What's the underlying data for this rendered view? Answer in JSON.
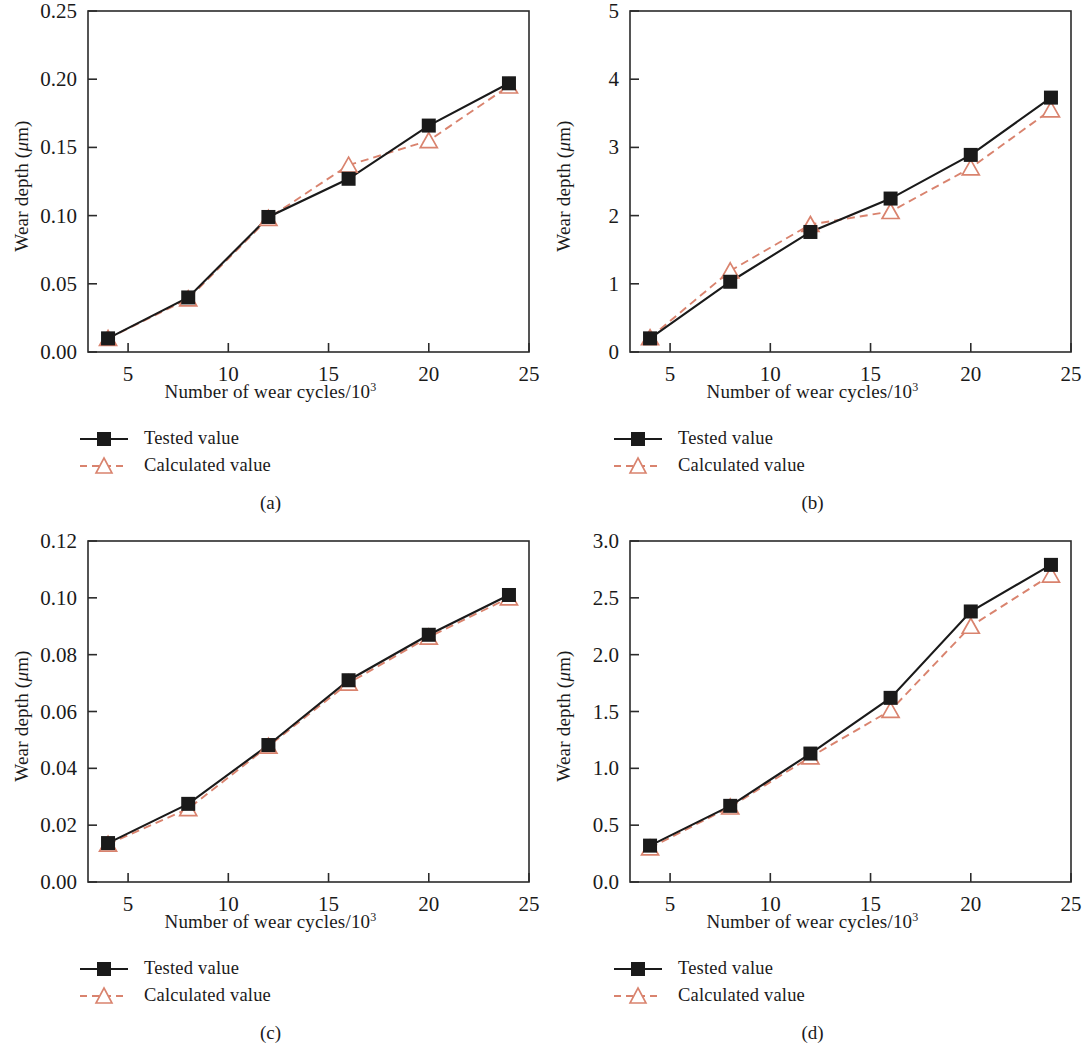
{
  "figure": {
    "axis_x_label_prefix": "Number of wear cycles/10",
    "axis_x_label_exponent": "3",
    "axis_y_label": "Wear depth (μm)",
    "legend": {
      "tested_label": "Tested value",
      "calculated_label": "Calculated value"
    },
    "colors": {
      "tested": "#1a1a1a",
      "calculated": "#d9836e",
      "axis": "#2b2b2b",
      "background": "#ffffff"
    },
    "captions": [
      "(a)",
      "(b)",
      "(c)",
      "(d)"
    ]
  },
  "chart_data": [
    {
      "type": "line",
      "panel": "(a)",
      "title": "",
      "xlabel": "Number of wear cycles/10^3",
      "ylabel": "Wear depth (μm)",
      "x": [
        4,
        8,
        12,
        16,
        20,
        24
      ],
      "xlim": [
        3,
        25
      ],
      "ylim": [
        0.0,
        0.25
      ],
      "xticks": [
        5,
        10,
        15,
        20,
        25
      ],
      "xticklabels": [
        "5",
        "10",
        "15",
        "20",
        "25"
      ],
      "yticks": [
        0.0,
        0.05,
        0.1,
        0.15,
        0.2,
        0.25
      ],
      "yticklabels": [
        "0.00",
        "0.05",
        "0.10",
        "0.15",
        "0.20",
        "0.25"
      ],
      "grid": false,
      "legend_position": "below-left",
      "series": [
        {
          "name": "Tested value",
          "marker": "filled-square",
          "line": "solid",
          "color": "#1a1a1a",
          "values": [
            0.01,
            0.04,
            0.099,
            0.127,
            0.166,
            0.197
          ]
        },
        {
          "name": "Calculated value",
          "marker": "open-triangle",
          "line": "dashed",
          "color": "#d9836e",
          "values": [
            0.01,
            0.039,
            0.098,
            0.137,
            0.155,
            0.195
          ]
        }
      ]
    },
    {
      "type": "line",
      "panel": "(b)",
      "title": "",
      "xlabel": "Number of wear cycles/10^3",
      "ylabel": "Wear depth (μm)",
      "x": [
        4,
        8,
        12,
        16,
        20,
        24
      ],
      "xlim": [
        3,
        25
      ],
      "ylim": [
        0,
        5
      ],
      "xticks": [
        5,
        10,
        15,
        20,
        25
      ],
      "xticklabels": [
        "5",
        "10",
        "15",
        "20",
        "25"
      ],
      "yticks": [
        0,
        1,
        2,
        3,
        4,
        5
      ],
      "yticklabels": [
        "0",
        "1",
        "2",
        "3",
        "4",
        "5"
      ],
      "grid": false,
      "legend_position": "below-left",
      "series": [
        {
          "name": "Tested value",
          "marker": "filled-square",
          "line": "solid",
          "color": "#1a1a1a",
          "values": [
            0.2,
            1.03,
            1.76,
            2.25,
            2.89,
            3.73
          ]
        },
        {
          "name": "Calculated value",
          "marker": "open-triangle",
          "line": "dashed",
          "color": "#d9836e",
          "values": [
            0.21,
            1.19,
            1.87,
            2.06,
            2.7,
            3.55
          ]
        }
      ]
    },
    {
      "type": "line",
      "panel": "(c)",
      "title": "",
      "xlabel": "Number of wear cycles/10^3",
      "ylabel": "Wear depth (μm)",
      "x": [
        4,
        8,
        12,
        16,
        20,
        24
      ],
      "xlim": [
        3,
        25
      ],
      "ylim": [
        0.0,
        0.12
      ],
      "xticks": [
        5,
        10,
        15,
        20,
        25
      ],
      "xticklabels": [
        "5",
        "10",
        "15",
        "20",
        "25"
      ],
      "yticks": [
        0.0,
        0.02,
        0.04,
        0.06,
        0.08,
        0.1,
        0.12
      ],
      "yticklabels": [
        "0.00",
        "0.02",
        "0.04",
        "0.06",
        "0.08",
        "0.10",
        "0.12"
      ],
      "grid": false,
      "legend_position": "below-left",
      "series": [
        {
          "name": "Tested value",
          "marker": "filled-square",
          "line": "solid",
          "color": "#1a1a1a",
          "values": [
            0.0137,
            0.0275,
            0.0482,
            0.071,
            0.087,
            0.101
          ]
        },
        {
          "name": "Calculated value",
          "marker": "open-triangle",
          "line": "dashed",
          "color": "#d9836e",
          "values": [
            0.0133,
            0.0258,
            0.0478,
            0.07,
            0.0862,
            0.1
          ]
        }
      ]
    },
    {
      "type": "line",
      "panel": "(d)",
      "title": "",
      "xlabel": "Number of wear cycles/10^3",
      "ylabel": "Wear depth (μm)",
      "x": [
        4,
        8,
        12,
        16,
        20,
        24
      ],
      "xlim": [
        3,
        25
      ],
      "ylim": [
        0.0,
        3.0
      ],
      "xticks": [
        5,
        10,
        15,
        20,
        25
      ],
      "xticklabels": [
        "5",
        "10",
        "15",
        "20",
        "25"
      ],
      "yticks": [
        0.0,
        0.5,
        1.0,
        1.5,
        2.0,
        2.5,
        3.0
      ],
      "yticklabels": [
        "0.0",
        "0.5",
        "1.0",
        "1.5",
        "2.0",
        "2.5",
        "3.0"
      ],
      "grid": false,
      "legend_position": "below-left",
      "series": [
        {
          "name": "Tested value",
          "marker": "filled-square",
          "line": "solid",
          "color": "#1a1a1a",
          "values": [
            0.32,
            0.67,
            1.13,
            1.62,
            2.38,
            2.79
          ]
        },
        {
          "name": "Calculated value",
          "marker": "open-triangle",
          "line": "dashed",
          "color": "#d9836e",
          "values": [
            0.3,
            0.66,
            1.1,
            1.51,
            2.25,
            2.7
          ]
        }
      ]
    }
  ]
}
